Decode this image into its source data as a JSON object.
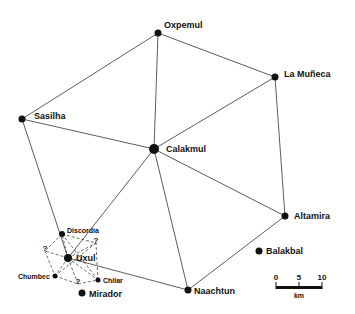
{
  "sites": [
    {
      "name": "Oxpemul",
      "x": 158,
      "y": 33,
      "r": 3.5,
      "lx": 164,
      "ly": 28,
      "fs": 9
    },
    {
      "name": "La Muñeca",
      "x": 275,
      "y": 77,
      "r": 3.5,
      "lx": 284,
      "ly": 77,
      "fs": 9
    },
    {
      "name": "Sasilha",
      "x": 22,
      "y": 119,
      "r": 3.5,
      "lx": 34,
      "ly": 119,
      "fs": 9
    },
    {
      "name": "Calakmul",
      "x": 154,
      "y": 149,
      "r": 5,
      "lx": 166,
      "ly": 152,
      "fs": 9
    },
    {
      "name": "Altamira",
      "x": 285,
      "y": 216,
      "r": 3.5,
      "lx": 294,
      "ly": 219,
      "fs": 9
    },
    {
      "name": "Balakbal",
      "x": 259,
      "y": 251,
      "r": 3.5,
      "lx": 266,
      "ly": 254,
      "fs": 9
    },
    {
      "name": "Naachtun",
      "x": 188,
      "y": 290,
      "r": 3.5,
      "lx": 194,
      "ly": 294,
      "fs": 9
    },
    {
      "name": "Discordia",
      "x": 62,
      "y": 234,
      "r": 3,
      "lx": 67,
      "ly": 233,
      "fs": 7
    },
    {
      "name": "Uxul",
      "x": 68,
      "y": 258,
      "r": 4,
      "lx": 76,
      "ly": 261,
      "fs": 9
    },
    {
      "name": "Chumbec",
      "x": 55,
      "y": 276,
      "r": 2.5,
      "lx": 18,
      "ly": 279,
      "fs": 7
    },
    {
      "name": "Chilar",
      "x": 98,
      "y": 280,
      "r": 2.5,
      "lx": 103,
      "ly": 283,
      "fs": 7
    },
    {
      "name": "Mirador",
      "x": 82,
      "y": 293,
      "r": 3.5,
      "lx": 89,
      "ly": 297,
      "fs": 9
    }
  ],
  "unknown_points": [
    {
      "label": "?",
      "x": 45,
      "y": 251
    },
    {
      "label": "?",
      "x": 96,
      "y": 243
    },
    {
      "label": "?",
      "x": 78,
      "y": 284
    }
  ],
  "solid_links": [
    [
      22,
      119,
      158,
      33
    ],
    [
      158,
      33,
      275,
      77
    ],
    [
      158,
      33,
      154,
      149
    ],
    [
      275,
      77,
      154,
      149
    ],
    [
      275,
      77,
      285,
      216
    ],
    [
      22,
      119,
      154,
      149
    ],
    [
      22,
      119,
      68,
      258
    ],
    [
      154,
      149,
      285,
      216
    ],
    [
      154,
      149,
      188,
      290
    ],
    [
      154,
      149,
      68,
      258
    ],
    [
      285,
      216,
      188,
      290
    ],
    [
      188,
      290,
      68,
      258
    ]
  ],
  "dashed_links": [
    [
      62,
      234,
      96,
      243
    ],
    [
      62,
      234,
      45,
      251
    ],
    [
      45,
      251,
      55,
      276
    ],
    [
      55,
      276,
      78,
      284
    ],
    [
      78,
      284,
      98,
      280
    ],
    [
      98,
      280,
      96,
      243
    ],
    [
      68,
      258,
      62,
      234
    ],
    [
      68,
      258,
      45,
      251
    ],
    [
      68,
      258,
      55,
      276
    ],
    [
      68,
      258,
      78,
      284
    ],
    [
      68,
      258,
      98,
      280
    ],
    [
      68,
      258,
      96,
      243
    ],
    [
      62,
      234,
      98,
      280
    ],
    [
      96,
      243,
      55,
      276
    ]
  ],
  "scale_bar": {
    "ticks": [
      "0",
      "5",
      "10"
    ],
    "unit": "km"
  }
}
